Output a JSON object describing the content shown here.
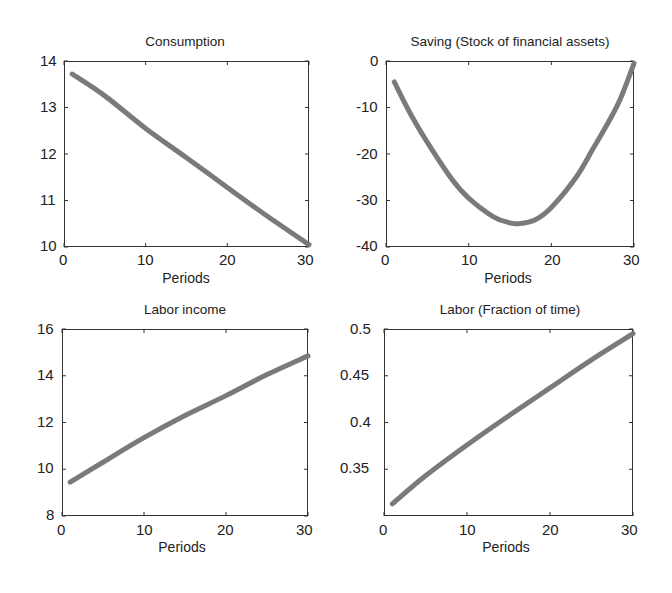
{
  "figure": {
    "line_color": "#7a7a7a",
    "axis_color": "#333333"
  },
  "chart_data": [
    {
      "type": "line",
      "title": "Consumption",
      "xlabel": "Periods",
      "ylabel": "",
      "xlim": [
        0,
        30
      ],
      "ylim": [
        10,
        14
      ],
      "xticks": [
        "0",
        "10",
        "20",
        "30"
      ],
      "yticks": [
        "10",
        "11",
        "12",
        "13",
        "14"
      ],
      "grid": false,
      "x": [
        1,
        5,
        10,
        15,
        20,
        25,
        30
      ],
      "values": [
        13.72,
        13.25,
        12.55,
        11.92,
        11.28,
        10.65,
        10.05
      ]
    },
    {
      "type": "line",
      "title": "Saving (Stock of financial assets)",
      "xlabel": "Periods",
      "ylabel": "",
      "xlim": [
        0,
        30
      ],
      "ylim": [
        -40,
        0
      ],
      "xticks": [
        "0",
        "10",
        "20",
        "30"
      ],
      "yticks": [
        "-40",
        "-30",
        "-20",
        "-10",
        "0"
      ],
      "grid": false,
      "x": [
        1,
        3,
        5,
        8,
        10,
        13,
        15,
        16,
        18,
        20,
        23,
        25,
        28,
        30
      ],
      "values": [
        -4.5,
        -11.5,
        -17.5,
        -25.5,
        -29.5,
        -33.5,
        -34.8,
        -35,
        -34.2,
        -31.5,
        -25,
        -19,
        -9.5,
        -0.5
      ]
    },
    {
      "type": "line",
      "title": "Labor income",
      "xlabel": "Periods",
      "ylabel": "",
      "xlim": [
        0,
        30
      ],
      "ylim": [
        8,
        16
      ],
      "xticks": [
        "0",
        "10",
        "20",
        "30"
      ],
      "yticks": [
        "8",
        "10",
        "12",
        "14",
        "16"
      ],
      "grid": false,
      "x": [
        1,
        5,
        10,
        15,
        20,
        25,
        30
      ],
      "values": [
        9.45,
        10.3,
        11.35,
        12.3,
        13.15,
        14.05,
        14.85
      ]
    },
    {
      "type": "line",
      "title": "Labor (Fraction of time)",
      "xlabel": "Periods",
      "ylabel": "",
      "xlim": [
        0,
        30
      ],
      "ylim": [
        0.3,
        0.5
      ],
      "xticks": [
        "0",
        "10",
        "20",
        "30"
      ],
      "yticks": [
        "0.35",
        "0.4",
        "0.45",
        "0.5"
      ],
      "grid": false,
      "x": [
        1,
        5,
        10,
        15,
        20,
        25,
        30
      ],
      "values": [
        0.313,
        0.343,
        0.376,
        0.407,
        0.437,
        0.467,
        0.495
      ]
    }
  ]
}
